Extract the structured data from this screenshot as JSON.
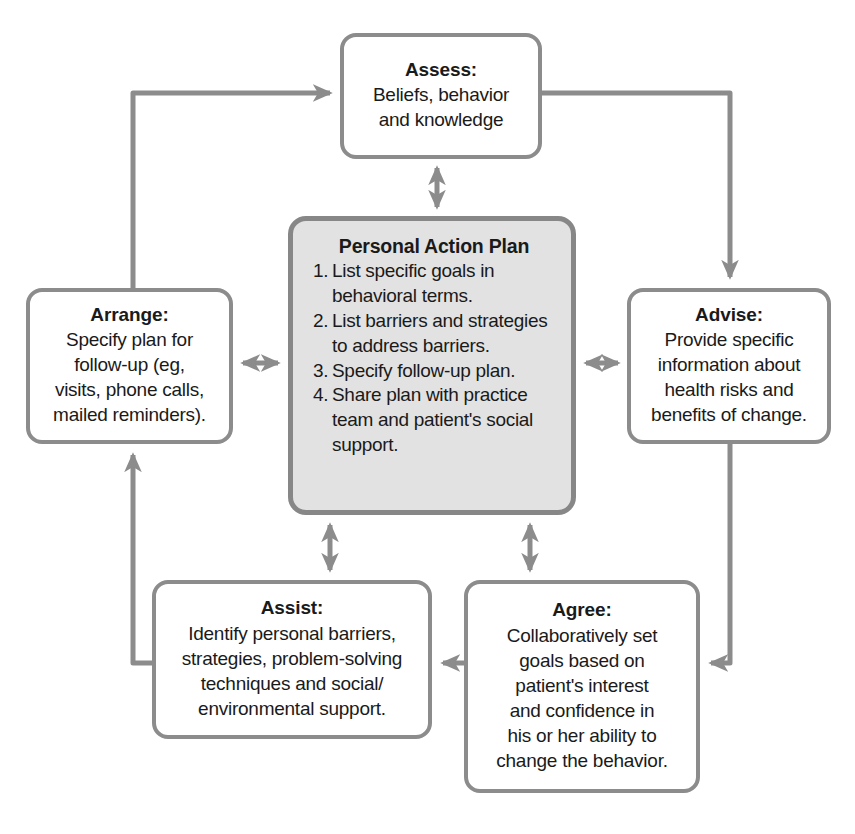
{
  "diagram": {
    "type": "cycle-flow-diagram",
    "colors": {
      "node_border": "#8c8c8c",
      "node_fill": "#ffffff",
      "center_fill": "#e2e2e2",
      "center_border": "#878787",
      "connector": "#8c8c8c",
      "text": "#1a1a1a",
      "background": "#ffffff"
    }
  },
  "nodes": {
    "assess": {
      "id": "assess",
      "title": "Assess:",
      "body": "Beliefs, behavior\nand knowledge"
    },
    "advise": {
      "id": "advise",
      "title": "Advise:",
      "body": "Provide specific\ninformation about\nhealth risks and\nbenefits of change."
    },
    "agree": {
      "id": "agree",
      "title": "Agree:",
      "body": "Collaboratively set\ngoals based on\npatient's interest\nand confidence in\nhis or her ability to\nchange the behavior."
    },
    "assist": {
      "id": "assist",
      "title": "Assist:",
      "body": "Identify personal barriers,\nstrategies, problem-solving\ntechniques and social/\nenvironmental support."
    },
    "arrange": {
      "id": "arrange",
      "title": "Arrange:",
      "body": "Specify plan for\nfollow-up (eg,\nvisits, phone calls,\nmailed reminders)."
    },
    "plan": {
      "id": "personal-action-plan",
      "title": "Personal Action Plan",
      "items": [
        {
          "num": "1.",
          "text": "List specific goals in behavioral terms."
        },
        {
          "num": "2.",
          "text": "List barriers and strategies to address barriers."
        },
        {
          "num": "3.",
          "text": "Specify follow-up plan."
        },
        {
          "num": "4.",
          "text": "Share plan with practice team and patient's social support."
        }
      ]
    }
  },
  "connectors": [
    {
      "name": "arrange-to-assess",
      "from": "arrange",
      "to": "assess",
      "style": "single-arrow",
      "path": "up-right"
    },
    {
      "name": "assess-to-advise",
      "from": "assess",
      "to": "advise",
      "style": "single-arrow",
      "path": "right-down"
    },
    {
      "name": "advise-to-agree",
      "from": "advise",
      "to": "agree",
      "style": "single-arrow",
      "path": "down-left"
    },
    {
      "name": "agree-to-assist",
      "from": "agree",
      "to": "assist",
      "style": "single-arrow",
      "path": "left"
    },
    {
      "name": "assist-to-arrange",
      "from": "assist",
      "to": "arrange",
      "style": "single-arrow",
      "path": "left-up"
    },
    {
      "name": "assess-plan-link",
      "from": "assess",
      "to": "plan",
      "style": "double-arrow",
      "path": "vertical"
    },
    {
      "name": "arrange-plan-link",
      "from": "arrange",
      "to": "plan",
      "style": "double-arrow",
      "path": "horizontal"
    },
    {
      "name": "advise-plan-link",
      "from": "advise",
      "to": "plan",
      "style": "double-arrow",
      "path": "horizontal"
    },
    {
      "name": "assist-plan-link",
      "from": "assist",
      "to": "plan",
      "style": "double-arrow",
      "path": "vertical"
    },
    {
      "name": "agree-plan-link",
      "from": "agree",
      "to": "plan",
      "style": "double-arrow",
      "path": "vertical"
    }
  ]
}
